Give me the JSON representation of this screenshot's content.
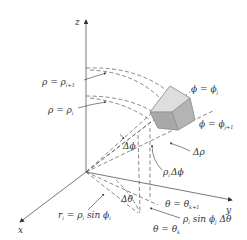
{
  "figure": {
    "axes": {
      "x": "x",
      "y": "y",
      "z": "z"
    },
    "labels": {
      "rho_outer": {
        "main": "ρ = ρ",
        "sub": "i+1"
      },
      "rho_inner": {
        "main": "ρ = ρ",
        "sub": "i"
      },
      "phi_j": {
        "main": "ϕ = ϕ",
        "sub": "j"
      },
      "phi_j1": {
        "main": "ϕ = ϕ",
        "sub": "j+1"
      },
      "delta_phi": "Δϕ",
      "delta_rho": "Δρ",
      "rho_delta_phi": {
        "pre": "ρ",
        "sub": "i",
        "post": "Δϕ"
      },
      "delta_theta": "Δθ",
      "theta_k1": {
        "main": "θ = θ",
        "sub": "k+1"
      },
      "theta_k": {
        "main": "θ = θ",
        "sub": "k"
      },
      "arc_theta": {
        "pre": "ρ",
        "sub1": "i",
        "mid": " sin ϕ",
        "sub2": "j",
        "post": " Δθ"
      },
      "radius": {
        "pre": "r",
        "sub1": "i",
        "mid": " = ρ",
        "sub2": "i",
        "mid2": " sin ϕ",
        "sub3": "i"
      }
    },
    "colors": {
      "line": "#444444",
      "dash": "#555555",
      "solid_fill": "#c8c8c8",
      "solid_light": "#dedede",
      "solid_dark": "#a8a8a8"
    }
  }
}
